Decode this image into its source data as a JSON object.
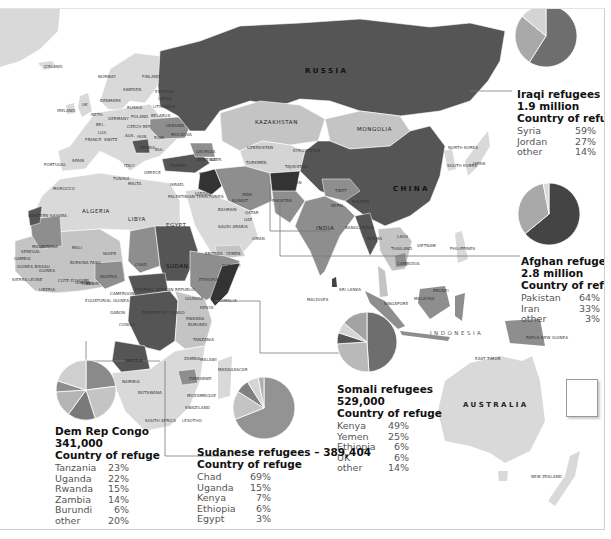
{
  "map": {
    "title_regions": {
      "russia": "RUSSIA",
      "china": "CHINA",
      "kazakhstan": "KAZAKHSTAN",
      "mongolia": "MONGOLIA",
      "india": "INDIA",
      "australia": "AUSTRALIA",
      "indonesia": "INDONESIA",
      "algeria": "ALGERIA",
      "libya": "LIBYA",
      "egypt": "EGYPT",
      "sudan": "SUDAN",
      "chad": "CHAD",
      "niger": "NIGER",
      "mali": "MALI",
      "mauritania": "MAURITANIA",
      "angola": "ANGOLA",
      "iran": "IRAN",
      "japan": "JAPAN"
    },
    "country_labels": [
      {
        "text": "ICELAND",
        "x": 44,
        "y": 64
      },
      {
        "text": "NORWAY",
        "x": 98,
        "y": 74
      },
      {
        "text": "FINLAND",
        "x": 142,
        "y": 74
      },
      {
        "text": "SWEDEN",
        "x": 123,
        "y": 87
      },
      {
        "text": "ESTONIA",
        "x": 155,
        "y": 89
      },
      {
        "text": "LATVIA",
        "x": 158,
        "y": 96
      },
      {
        "text": "DENMARK",
        "x": 100,
        "y": 98
      },
      {
        "text": "RUSSIA",
        "x": 127,
        "y": 105
      },
      {
        "text": "LITHUANIA",
        "x": 153,
        "y": 104
      },
      {
        "text": "IRELAND",
        "x": 57,
        "y": 108
      },
      {
        "text": "UK",
        "x": 82,
        "y": 102
      },
      {
        "text": "NETH.",
        "x": 91,
        "y": 112
      },
      {
        "text": "GERMANY",
        "x": 108,
        "y": 116
      },
      {
        "text": "POLAND",
        "x": 131,
        "y": 114
      },
      {
        "text": "BELARUS",
        "x": 151,
        "y": 113
      },
      {
        "text": "BEL.",
        "x": 96,
        "y": 122
      },
      {
        "text": "LUX.",
        "x": 98,
        "y": 130
      },
      {
        "text": "CZECH REP.",
        "x": 127,
        "y": 124
      },
      {
        "text": "UKRAINE",
        "x": 166,
        "y": 123
      },
      {
        "text": "MOLDOVA",
        "x": 171,
        "y": 132
      },
      {
        "text": "FRANCE",
        "x": 85,
        "y": 137
      },
      {
        "text": "SWITZ.",
        "x": 104,
        "y": 137
      },
      {
        "text": "AUS.",
        "x": 125,
        "y": 133
      },
      {
        "text": "HUN.",
        "x": 137,
        "y": 134
      },
      {
        "text": "ROM.",
        "x": 154,
        "y": 135
      },
      {
        "text": "BUL.",
        "x": 155,
        "y": 147
      },
      {
        "text": "SERBIA",
        "x": 140,
        "y": 145
      },
      {
        "text": "ITALY",
        "x": 124,
        "y": 163
      },
      {
        "text": "SPAIN",
        "x": 72,
        "y": 158
      },
      {
        "text": "PORTUGAL",
        "x": 44,
        "y": 162
      },
      {
        "text": "TURKEY",
        "x": 170,
        "y": 163
      },
      {
        "text": "GREECE",
        "x": 144,
        "y": 170
      },
      {
        "text": "GEORGIA",
        "x": 196,
        "y": 149
      },
      {
        "text": "ARMENIA",
        "x": 197,
        "y": 157
      },
      {
        "text": "AZER.",
        "x": 210,
        "y": 157
      },
      {
        "text": "UZBEKISTAN",
        "x": 247,
        "y": 145
      },
      {
        "text": "KYRGYZSTAN",
        "x": 293,
        "y": 148
      },
      {
        "text": "TURKMEN.",
        "x": 246,
        "y": 160
      },
      {
        "text": "TAJIKISTAN",
        "x": 285,
        "y": 164
      },
      {
        "text": "AFGHANISTAN",
        "x": 272,
        "y": 180
      },
      {
        "text": "PAKISTAN",
        "x": 272,
        "y": 198
      },
      {
        "text": "NEPAL",
        "x": 331,
        "y": 203
      },
      {
        "text": "TIBET",
        "x": 335,
        "y": 188
      },
      {
        "text": "BHUTAN",
        "x": 352,
        "y": 199
      },
      {
        "text": "BANGLADESH",
        "x": 345,
        "y": 225
      },
      {
        "text": "BURMA",
        "x": 367,
        "y": 236
      },
      {
        "text": "LAOS",
        "x": 397,
        "y": 234
      },
      {
        "text": "THAILAND",
        "x": 391,
        "y": 246
      },
      {
        "text": "CAMBODIA",
        "x": 397,
        "y": 261
      },
      {
        "text": "VIETNAM",
        "x": 417,
        "y": 243
      },
      {
        "text": "PHILIPPINES",
        "x": 450,
        "y": 246
      },
      {
        "text": "NORTH KOREA",
        "x": 448,
        "y": 145
      },
      {
        "text": "SOUTH KOREA",
        "x": 447,
        "y": 163
      },
      {
        "text": "SYRIA",
        "x": 199,
        "y": 171
      },
      {
        "text": "IRAQ",
        "x": 209,
        "y": 181
      },
      {
        "text": "ISRAEL",
        "x": 170,
        "y": 182
      },
      {
        "text": "JORDAN",
        "x": 195,
        "y": 191
      },
      {
        "text": "PALESTINIAN TERRITORIES",
        "x": 168,
        "y": 194
      },
      {
        "text": "KUWAIT",
        "x": 232,
        "y": 198
      },
      {
        "text": "BAHRAIN",
        "x": 218,
        "y": 207
      },
      {
        "text": "QATAR",
        "x": 245,
        "y": 210
      },
      {
        "text": "UAE",
        "x": 244,
        "y": 217
      },
      {
        "text": "SAUDI ARABIA",
        "x": 218,
        "y": 224
      },
      {
        "text": "OMAN",
        "x": 252,
        "y": 236
      },
      {
        "text": "YEMEN",
        "x": 226,
        "y": 251
      },
      {
        "text": "ERITREA",
        "x": 205,
        "y": 251
      },
      {
        "text": "DJIBOUTI",
        "x": 222,
        "y": 263
      },
      {
        "text": "ETHIOPIA",
        "x": 199,
        "y": 277
      },
      {
        "text": "SOMALIA",
        "x": 218,
        "y": 298
      },
      {
        "text": "UGANDA",
        "x": 185,
        "y": 296
      },
      {
        "text": "KENYA",
        "x": 200,
        "y": 305
      },
      {
        "text": "RWANDA",
        "x": 186,
        "y": 316
      },
      {
        "text": "BURUNDI",
        "x": 188,
        "y": 322
      },
      {
        "text": "TANZANIA",
        "x": 193,
        "y": 337
      },
      {
        "text": "ZAMBIA",
        "x": 184,
        "y": 356
      },
      {
        "text": "MALAWI",
        "x": 200,
        "y": 357
      },
      {
        "text": "ZIMBABWE",
        "x": 189,
        "y": 376
      },
      {
        "text": "MOZAMBIQUE",
        "x": 187,
        "y": 393
      },
      {
        "text": "MADAGASCAR",
        "x": 218,
        "y": 367
      },
      {
        "text": "SWAZILAND",
        "x": 185,
        "y": 405
      },
      {
        "text": "LESOTHO",
        "x": 182,
        "y": 418
      },
      {
        "text": "NAMIBIA",
        "x": 122,
        "y": 379
      },
      {
        "text": "BOTSWANA",
        "x": 138,
        "y": 390
      },
      {
        "text": "SOUTH AFRICA",
        "x": 145,
        "y": 418
      },
      {
        "text": "MOROCCO",
        "x": 53,
        "y": 186
      },
      {
        "text": "TUNISIA",
        "x": 113,
        "y": 176
      },
      {
        "text": "MALTA",
        "x": 128,
        "y": 181
      },
      {
        "text": "WESTERN SAHARA",
        "x": 28,
        "y": 213
      },
      {
        "text": "SENEGAL",
        "x": 21,
        "y": 249
      },
      {
        "text": "GAMBIA",
        "x": 14,
        "y": 256
      },
      {
        "text": "GUINEA BISSAU",
        "x": 17,
        "y": 264
      },
      {
        "text": "GUINEA",
        "x": 39,
        "y": 268
      },
      {
        "text": "SIERRA LEONE",
        "x": 12,
        "y": 277
      },
      {
        "text": "LIBERIA",
        "x": 39,
        "y": 287
      },
      {
        "text": "COTE D'IVOIRE",
        "x": 58,
        "y": 278
      },
      {
        "text": "BURKINA FASO",
        "x": 70,
        "y": 260
      },
      {
        "text": "GHANA",
        "x": 75,
        "y": 280
      },
      {
        "text": "TOGO",
        "x": 81,
        "y": 281
      },
      {
        "text": "BENIN",
        "x": 86,
        "y": 281
      },
      {
        "text": "NIGERIA",
        "x": 100,
        "y": 274
      },
      {
        "text": "CAMEROON",
        "x": 110,
        "y": 291
      },
      {
        "text": "CENTRAL AFRICAN REPUBLIC",
        "x": 135,
        "y": 287
      },
      {
        "text": "EQUATORIAL GUINEA",
        "x": 85,
        "y": 298
      },
      {
        "text": "GABON",
        "x": 110,
        "y": 310
      },
      {
        "text": "CONGO",
        "x": 119,
        "y": 322
      },
      {
        "text": "DEM REP OF CONGO",
        "x": 142,
        "y": 310
      },
      {
        "text": "SRI LANKA",
        "x": 339,
        "y": 287
      },
      {
        "text": "MALDIVES",
        "x": 307,
        "y": 297
      },
      {
        "text": "SINGAPORE",
        "x": 384,
        "y": 301
      },
      {
        "text": "BRUNEI",
        "x": 433,
        "y": 288
      },
      {
        "text": "MALAYSIA",
        "x": 414,
        "y": 296
      },
      {
        "text": "EAST TIMOR",
        "x": 475,
        "y": 356
      },
      {
        "text": "PAPUA NEW GUINEA",
        "x": 526,
        "y": 335
      },
      {
        "text": "NEW ZEALAND",
        "x": 531,
        "y": 474
      },
      {
        "text": "FIJI",
        "x": 576,
        "y": 383
      }
    ]
  },
  "legends": {
    "iraqi": {
      "title_line1": "Iraqi refugees",
      "title_line2": "1.9 million",
      "title_line3": "Country of refuge",
      "rows": [
        {
          "country": "Syria",
          "pct": "59%"
        },
        {
          "country": "Jordan",
          "pct": "27%"
        },
        {
          "country": "other",
          "pct": "14%"
        }
      ]
    },
    "afghan": {
      "title_line1": "Afghan refugees",
      "title_line2": "2.8 million",
      "title_line3": "Country of refuge",
      "rows": [
        {
          "country": "Pakistan",
          "pct": "64%"
        },
        {
          "country": "Iran",
          "pct": "33%"
        },
        {
          "country": "other",
          "pct": "3%"
        }
      ]
    },
    "somali": {
      "title_line1": "Somali refugees",
      "title_line2": "529,000",
      "title_line3": "Country of refuge",
      "rows": [
        {
          "country": "Kenya",
          "pct": "49%"
        },
        {
          "country": "Yemen",
          "pct": "25%"
        },
        {
          "country": "Ethiopia",
          "pct": "6%"
        },
        {
          "country": "UK",
          "pct": "6%"
        },
        {
          "country": "other",
          "pct": "14%"
        }
      ]
    },
    "sudanese": {
      "title_line1": "Sudanese refugees – 389,404",
      "title_line2": "Country of refuge",
      "rows": [
        {
          "country": "Chad",
          "pct": "69%"
        },
        {
          "country": "Uganda",
          "pct": "15%"
        },
        {
          "country": "Kenya",
          "pct": "7%"
        },
        {
          "country": "Ethiopia",
          "pct": "6%"
        },
        {
          "country": "Egypt",
          "pct": "3%"
        }
      ]
    },
    "drc": {
      "title_line1": "Dem Rep Congo",
      "title_line2": "341,000",
      "title_line3": "Country of refuge",
      "rows": [
        {
          "country": "Tanzania",
          "pct": "23%"
        },
        {
          "country": "Uganda",
          "pct": "22%"
        },
        {
          "country": "Rwanda",
          "pct": "15%"
        },
        {
          "country": "Zambia",
          "pct": "14%"
        },
        {
          "country": "Burundi",
          "pct": "6%"
        },
        {
          "country": "other",
          "pct": "20%"
        }
      ]
    }
  },
  "colors": {
    "ocean": "#ffffff",
    "land_light": "#d9d9d9",
    "land_mid": "#a9a9a9",
    "land_midlight": "#c4c4c4",
    "land_dark": "#6e6e6e",
    "land_darker": "#555555",
    "land_darkest": "#333333",
    "leader": "#7a7a7a"
  },
  "chart_data": [
    {
      "type": "pie",
      "title": "Iraqi refugees 1.9 million – Country of refuge",
      "categories": [
        "Syria",
        "Jordan",
        "other"
      ],
      "values": [
        59,
        27,
        14
      ],
      "colors": [
        "#6e6e6e",
        "#a9a9a9",
        "#d4d4d4"
      ]
    },
    {
      "type": "pie",
      "title": "Afghan refugees 2.8 million – Country of refuge",
      "categories": [
        "Pakistan",
        "Iran",
        "other"
      ],
      "values": [
        64,
        33,
        3
      ],
      "colors": [
        "#444444",
        "#a9a9a9",
        "#d9d9d9"
      ]
    },
    {
      "type": "pie",
      "title": "Somali refugees 529,000 – Country of refuge",
      "categories": [
        "Kenya",
        "Yemen",
        "Ethiopia",
        "UK",
        "other"
      ],
      "values": [
        49,
        25,
        6,
        6,
        14
      ],
      "colors": [
        "#6e6e6e",
        "#b9b9b9",
        "#555555",
        "#d4d4d4",
        "#a3a3a3"
      ]
    },
    {
      "type": "pie",
      "title": "Sudanese refugees – 389,404 – Country of refuge",
      "categories": [
        "Chad",
        "Uganda",
        "Kenya",
        "Ethiopia",
        "Egypt"
      ],
      "values": [
        69,
        15,
        7,
        6,
        3
      ],
      "colors": [
        "#939393",
        "#c4c4c4",
        "#808080",
        "#d4d4d4",
        "#b0b0b0"
      ]
    },
    {
      "type": "pie",
      "title": "Dem Rep Congo 341,000 – Country of refuge",
      "categories": [
        "Tanzania",
        "Uganda",
        "Rwanda",
        "Zambia",
        "Burundi",
        "other"
      ],
      "values": [
        23,
        22,
        15,
        14,
        6,
        20
      ],
      "colors": [
        "#8a8a8a",
        "#c4c4c4",
        "#7a7a7a",
        "#b5b5b5",
        "#8e8e8e",
        "#cfcfcf"
      ]
    }
  ]
}
